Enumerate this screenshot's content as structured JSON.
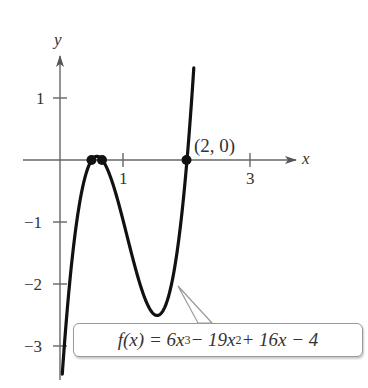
{
  "chart_data": {
    "type": "line",
    "title": "",
    "function_label": {
      "lhs": "f(x) = 6x",
      "exp3": "3",
      "mid": " − 19x",
      "exp2": "2",
      "rhs": " + 16x − 4"
    },
    "function": "6x^3 - 19x^2 + 16x - 4",
    "xlabel": "x",
    "ylabel": "y",
    "x_ticks": [
      {
        "value": 1,
        "label": "1"
      },
      {
        "value": 3,
        "label": "3"
      }
    ],
    "y_ticks": [
      {
        "value": 1,
        "label": "1"
      },
      {
        "value": -1,
        "label": "−1"
      },
      {
        "value": -2,
        "label": "−2"
      },
      {
        "value": -3,
        "label": "−3"
      }
    ],
    "xlim": [
      -0.5,
      3.5
    ],
    "ylim": [
      -3.5,
      1.5
    ],
    "grid": false,
    "points": [
      {
        "x": 0.5,
        "y": 0,
        "label": ""
      },
      {
        "x": 0.6667,
        "y": 0,
        "label": ""
      },
      {
        "x": 2,
        "y": 0,
        "label": "(2, 0)"
      }
    ],
    "annotations": [
      "(2, 0)"
    ],
    "local_max": {
      "x": 0.58,
      "y": 0.01
    },
    "local_min": {
      "x": 1.53,
      "y": -2.5
    }
  }
}
